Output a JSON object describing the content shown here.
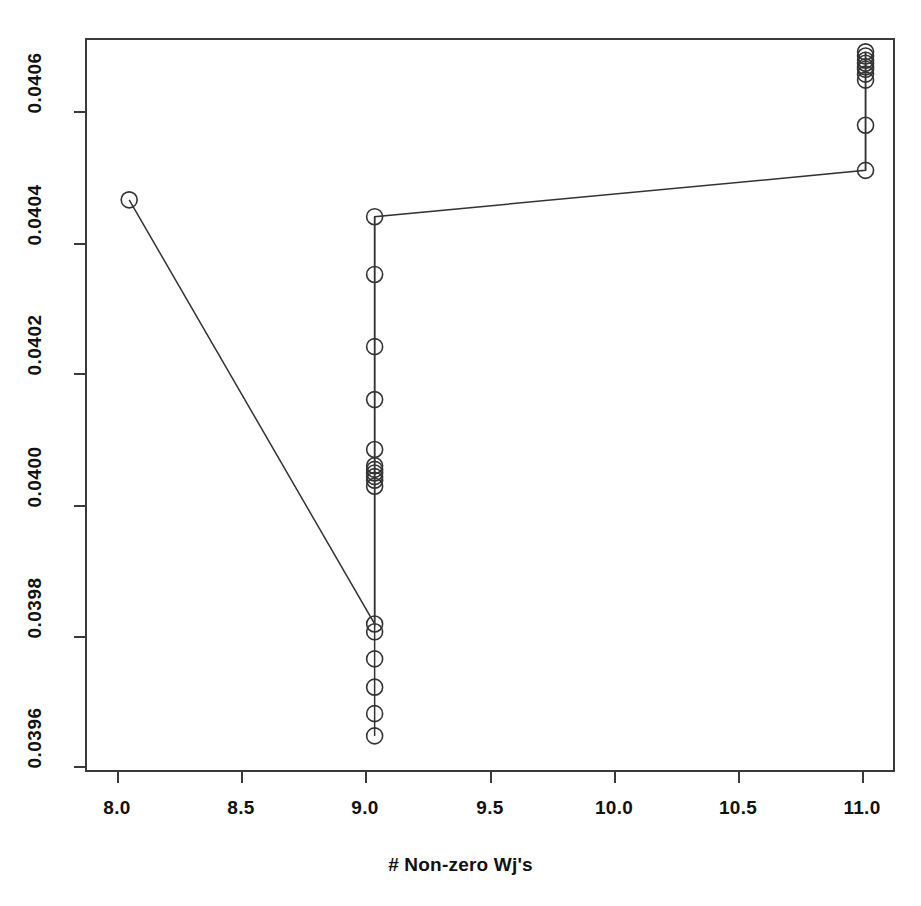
{
  "chart": {
    "title": "",
    "xlabel": "# Non-zero Wj's",
    "ylabel": ""
  },
  "axes": {
    "x_ticks": [
      "8.0",
      "8.5",
      "9.0",
      "9.5",
      "10.0",
      "10.5",
      "11.0"
    ],
    "y_ticks": [
      "0.0396",
      "0.0398",
      "0.0400",
      "0.0402",
      "0.0404",
      "0.0406"
    ]
  },
  "chart_data": {
    "type": "scatter",
    "title": "",
    "xlabel": "# Non-zero Wj's",
    "ylabel": "",
    "xlim": [
      7.82,
      11.12
    ],
    "ylim": [
      0.0395,
      0.04072
    ],
    "grid": false,
    "legend": null,
    "marker": "open-circle",
    "line_connects_points": true,
    "x_tick_values": [
      8.0,
      8.5,
      9.0,
      9.5,
      10.0,
      10.5,
      11.0
    ],
    "y_tick_values": [
      0.0396,
      0.0398,
      0.04,
      0.0402,
      0.0404,
      0.0406
    ],
    "x": [
      8.0,
      9.0,
      9.0,
      9.0,
      9.0,
      9.0,
      9.0,
      9.0,
      9.0,
      9.0,
      9.0,
      9.0,
      9.0,
      9.0,
      9.0,
      9.0,
      9.0,
      11.0,
      11.0,
      11.0,
      11.0,
      11.0,
      11.0,
      11.0,
      11.0,
      11.0,
      11.0,
      11.0
    ],
    "y": [
      0.040451,
      0.040423,
      0.040327,
      0.040207,
      0.040119,
      0.040036,
      0.040009,
      0.040003,
      0.039997,
      0.039991,
      0.039985,
      0.039975,
      0.039746,
      0.039733,
      0.039688,
      0.039641,
      0.039597,
      0.03956,
      0.0405,
      0.040575,
      0.04065,
      0.04066,
      0.040668,
      0.040672,
      0.040678,
      0.040683,
      0.04069,
      0.040697
    ],
    "path_order": [
      {
        "x": 8.0,
        "y": 0.040451
      },
      {
        "x": 9.0,
        "y": 0.039746
      },
      {
        "x": 9.0,
        "y": 0.040423
      },
      {
        "x": 11.0,
        "y": 0.0405
      },
      {
        "x": 11.0,
        "y": 0.040697
      }
    ],
    "clusters": [
      {
        "x": 9.0,
        "y_center": 0.04,
        "count": 6,
        "note": "dense overlapping markers near 0.0400"
      },
      {
        "x": 11.0,
        "y_center": 0.04067,
        "count": 8,
        "note": "dense overlapping markers near top"
      }
    ],
    "series": [
      {
        "name": "solution path",
        "points": [
          {
            "x": 8.0,
            "y": 0.040451
          },
          {
            "x": 9.0,
            "y": 0.040423
          },
          {
            "x": 9.0,
            "y": 0.040327
          },
          {
            "x": 9.0,
            "y": 0.040207
          },
          {
            "x": 9.0,
            "y": 0.040119
          },
          {
            "x": 9.0,
            "y": 0.040036
          },
          {
            "x": 9.0,
            "y": 0.040009
          },
          {
            "x": 9.0,
            "y": 0.040003
          },
          {
            "x": 9.0,
            "y": 0.039997
          },
          {
            "x": 9.0,
            "y": 0.039991
          },
          {
            "x": 9.0,
            "y": 0.039985
          },
          {
            "x": 9.0,
            "y": 0.039975
          },
          {
            "x": 9.0,
            "y": 0.039746
          },
          {
            "x": 9.0,
            "y": 0.039733
          },
          {
            "x": 9.0,
            "y": 0.039688
          },
          {
            "x": 9.0,
            "y": 0.039641
          },
          {
            "x": 9.0,
            "y": 0.039597
          },
          {
            "x": 9.0,
            "y": 0.03956
          },
          {
            "x": 11.0,
            "y": 0.0405
          },
          {
            "x": 11.0,
            "y": 0.040575
          },
          {
            "x": 11.0,
            "y": 0.04065
          },
          {
            "x": 11.0,
            "y": 0.04066
          },
          {
            "x": 11.0,
            "y": 0.040668
          },
          {
            "x": 11.0,
            "y": 0.040672
          },
          {
            "x": 11.0,
            "y": 0.040678
          },
          {
            "x": 11.0,
            "y": 0.040683
          },
          {
            "x": 11.0,
            "y": 0.04069
          },
          {
            "x": 11.0,
            "y": 0.040697
          }
        ]
      }
    ]
  },
  "style": {
    "frame_color": "#3a3a3a",
    "marker_color": "#333333",
    "line_color": "#333333",
    "background": "#ffffff"
  }
}
